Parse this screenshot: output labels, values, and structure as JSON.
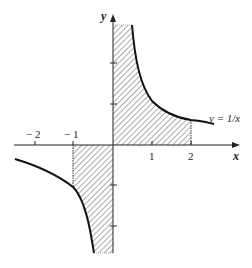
{
  "diagram": {
    "function_label": "y = 1/x",
    "axis_labels": {
      "x": "x",
      "y": "y"
    },
    "x_ticks": [
      {
        "value": -2,
        "label": "− 2"
      },
      {
        "value": -1,
        "label": "− 1"
      },
      {
        "value": 1,
        "label": "1"
      },
      {
        "value": 2,
        "label": "2"
      }
    ],
    "y_ticks": [
      -2,
      -1,
      1,
      2
    ],
    "shaded_regions": [
      {
        "from": 0,
        "to": 2,
        "side": "above x-axis",
        "pattern": "diagonal hatch"
      },
      {
        "from": -1,
        "to": 0,
        "side": "below x-axis",
        "pattern": "diagonal hatch"
      }
    ],
    "colors": {
      "ink": "#222222",
      "hatch": "#555555",
      "background": "#ffffff"
    }
  }
}
